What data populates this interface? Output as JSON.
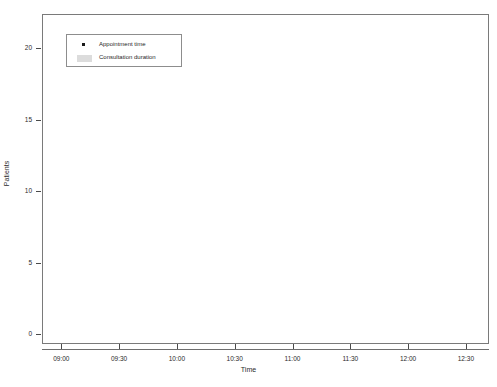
{
  "chart_data": {
    "type": "scatter",
    "title": "",
    "xlabel": "Time",
    "ylabel": "Patients",
    "grid": true,
    "legend_position": "top-left",
    "xtick_labels": [
      "09:00",
      "09:30",
      "10:00",
      "10:30",
      "11:00",
      "11:30",
      "12:00",
      "12:30"
    ],
    "xtick_minutes": [
      540,
      570,
      600,
      630,
      660,
      690,
      720,
      750
    ],
    "xlim_minutes": [
      530,
      762
    ],
    "ytick_labels": [
      "0",
      "5",
      "10",
      "15",
      "20"
    ],
    "ytick_values": [
      0,
      5,
      10,
      15,
      20
    ],
    "ylim": [
      -0.7,
      22.4
    ],
    "legend": [
      {
        "label": "Appointment time",
        "marker": "dot",
        "color": "#1a1a1a"
      },
      {
        "label": "Consultation duration",
        "marker": "bar",
        "color": "#d4d4d4"
      }
    ],
    "series": [
      {
        "name": "Appointment time",
        "x_minutes": [
          540,
          548,
          556,
          565,
          574,
          583,
          592,
          601,
          610,
          619,
          628,
          637,
          646,
          655,
          664,
          673,
          682,
          691,
          700,
          709,
          745
        ],
        "y": [
          1,
          2,
          3,
          4,
          5,
          6,
          7,
          8,
          9,
          10,
          11,
          12,
          13,
          14,
          15,
          16,
          17,
          18,
          19,
          20,
          21
        ]
      },
      {
        "name": "Consultation duration",
        "x_start_minutes": [
          538,
          548,
          556,
          565,
          574,
          583,
          592,
          601,
          610,
          619,
          628,
          637,
          646,
          655,
          664,
          673,
          682,
          691,
          700,
          709,
          745
        ],
        "x_end_minutes": [
          556,
          566,
          574,
          583,
          592,
          601,
          610,
          619,
          628,
          637,
          646,
          655,
          664,
          673,
          682,
          691,
          700,
          709,
          718,
          727,
          762
        ],
        "y": [
          1,
          2,
          3,
          4,
          5,
          6,
          7,
          8,
          9,
          10,
          11,
          12,
          13,
          14,
          15,
          16,
          17,
          18,
          19,
          20,
          21
        ]
      }
    ],
    "vertical_reference_lines_minutes": [
      540,
      750
    ]
  }
}
